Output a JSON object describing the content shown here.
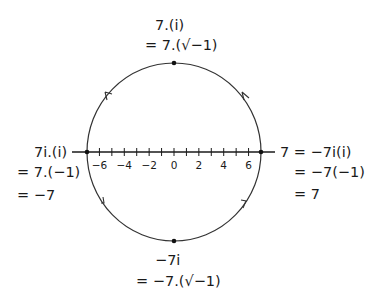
{
  "diagram": {
    "title": "",
    "circle": {
      "cx": 174,
      "cy": 152,
      "rx": 87,
      "ry": 89
    },
    "number_line": {
      "min": -7,
      "max": 7,
      "step": 1,
      "labels": [
        "−6",
        "−4",
        "−2",
        "0",
        "2",
        "4",
        "6"
      ],
      "label_values": [
        -6,
        -4,
        -2,
        0,
        2,
        4,
        6
      ]
    },
    "points": {
      "top": {
        "line1": "7.(i)",
        "line2": "= 7.(√−1)"
      },
      "left": {
        "line1": "7i.(i)",
        "line2": "= 7.(−1)",
        "line3": "= −7"
      },
      "right": {
        "line1": "7 = −7i(i)",
        "line2": "= −7(−1)",
        "line3": "= 7"
      },
      "bottom": {
        "line1": "−7i",
        "line2": "= −7.(√−1)"
      }
    },
    "arrows": [
      "upper-left counterclockwise",
      "upper-right counterclockwise",
      "lower-left counterclockwise",
      "lower-right counterclockwise"
    ],
    "colors": {
      "ink": "#1a1a1a",
      "background": "#ffffff"
    }
  }
}
